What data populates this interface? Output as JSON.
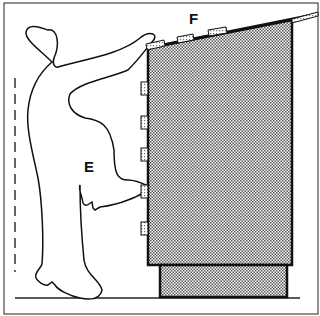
{
  "figure": {
    "labels": {
      "person": "E",
      "top_shelf": "F"
    },
    "colors": {
      "ink": "#111111",
      "background": "#ffffff",
      "hatch_fill": "#555555"
    },
    "shelf_items_on_top": 3,
    "side_tabs_on_cabinet": 5
  }
}
